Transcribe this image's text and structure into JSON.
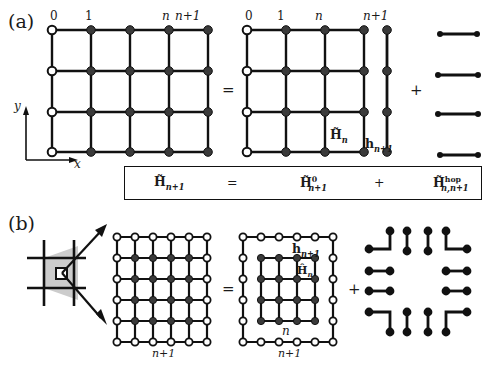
{
  "figure": {
    "panels": [
      {
        "tag": "(a)",
        "axes": {
          "x_label": "x",
          "y_label": "y"
        },
        "left_lattice": {
          "name": "lattice-n-plus-1-full",
          "columns": 5,
          "rows": 4,
          "open_column_index": 0,
          "top_labels": [
            "0",
            "1",
            "n",
            "n+1"
          ],
          "top_label_positions": [
            0,
            1,
            3,
            4
          ]
        },
        "equals_sign": "=",
        "middle_lattice": {
          "name": "lattice-n",
          "columns": 4,
          "rows": 4,
          "open_column_index": 0,
          "top_labels": [
            "0",
            "1",
            "n"
          ],
          "top_label_positions": [
            0,
            1,
            3
          ],
          "inline_label": "H̃n"
        },
        "plus_sign_1": "+",
        "chain": {
          "name": "chain-n-plus-1",
          "dots": 4,
          "top_label": "n+1",
          "inline_label": "hn+1"
        },
        "plus_sign_2": "+",
        "bonds": {
          "name": "hop-bonds-horizontal",
          "count": 4
        },
        "equation": {
          "lhs": "H̃n+1",
          "eq": "=",
          "term1": "H̃⁰n+1",
          "plus": "+",
          "term2": "H̃hopn,n+1"
        }
      },
      {
        "tag": "(b)",
        "magnifier": {
          "name": "zoom-inset",
          "arrows": 2,
          "shaded_region": true
        },
        "big_lattice": {
          "name": "lattice-b-n-plus-1",
          "columns": 6,
          "rows": 6,
          "border_open": true,
          "bottom_label": "n+1"
        },
        "equals_sign": "=",
        "nested_lattice": {
          "name": "lattice-b-nested",
          "outer_ring_label": "hn+1",
          "outer_bottom_label": "n+1",
          "inner_label": "Ĥn",
          "inner_bottom_label": "n",
          "inner_columns": 4,
          "inner_rows": 4,
          "outer_columns": 6,
          "outer_rows": 6
        },
        "plus_sign": "+",
        "bond_ring": {
          "name": "hop-bond-ring",
          "corners": 4,
          "edges": 8
        }
      }
    ],
    "colors": {
      "ink": "#111111",
      "node_fill_dark": "#3a3a3a",
      "node_fill_open": "#ffffff",
      "shade": "#c9c9c9",
      "background": "#ffffff"
    }
  }
}
